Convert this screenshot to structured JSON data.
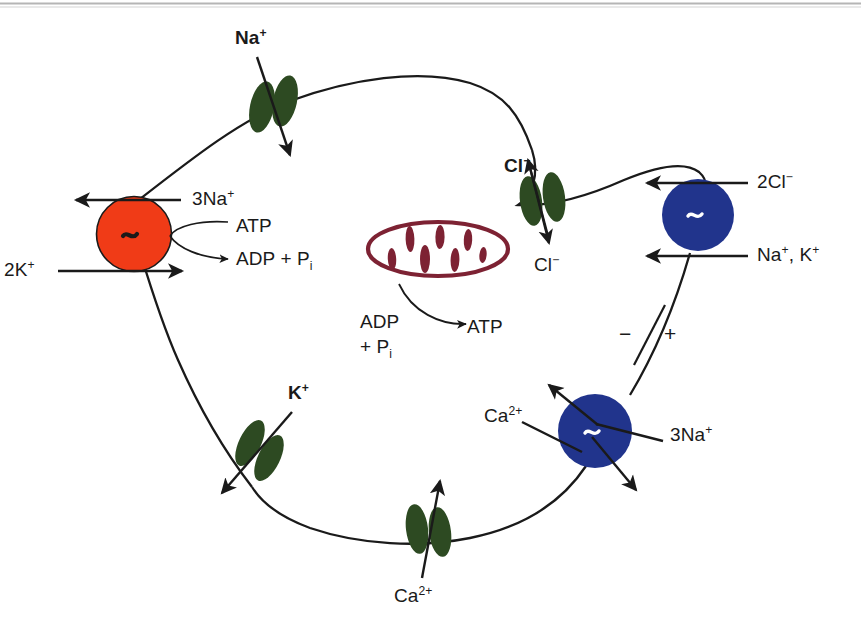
{
  "figure": {
    "kind": "cell-membrane-transport-diagram",
    "background": "#ffffff",
    "top_rule_color": "#9a9a9a"
  },
  "colors": {
    "atpase_red": "#f03b17",
    "transporter_blue": "#21348c",
    "channel_green": "#2d4a22",
    "mitochondrion_maroon": "#7d2233",
    "stroke_black": "#1a1a1a",
    "text_black": "#1a1a1a"
  },
  "pumps": [
    {
      "id": "na-k-atpase",
      "color": "#f03b17",
      "symbol": "~",
      "symbol_color": "#1a1a1a",
      "labels": {
        "out": "3Na",
        "out_charge": "+",
        "in": "2K",
        "in_charge": "+",
        "energy_in": "ATP",
        "energy_out": "ADP + P",
        "energy_out_sub": "i"
      }
    },
    {
      "id": "na-k-2cl-cotransporter",
      "color": "#21348c",
      "symbol": "~",
      "symbol_color": "#ffffff",
      "labels": {
        "top": "2Cl",
        "top_charge": "−",
        "bottom": "Na",
        "bottom_charge_1": "+",
        "bottom_2": ", K",
        "bottom_charge_2": "+"
      }
    },
    {
      "id": "na-ca-exchanger",
      "color": "#21348c",
      "symbol": "~",
      "symbol_color": "#ffffff",
      "labels": {
        "left": "Ca",
        "left_charge": "2+",
        "right": "3Na",
        "right_charge": "+",
        "minus_sign": "−",
        "plus_sign": "+"
      }
    }
  ],
  "channels": [
    {
      "id": "sodium-channel",
      "ion": "Na",
      "charge": "+",
      "direction": "inward",
      "color": "#2d4a22"
    },
    {
      "id": "chloride-channel",
      "ion_top": "Cl",
      "charge_top": "−",
      "ion_bottom": "Cl",
      "charge_bottom": "−",
      "direction": "bidirectional",
      "color": "#2d4a22"
    },
    {
      "id": "potassium-channel",
      "ion": "K",
      "charge": "+",
      "direction": "outward",
      "color": "#2d4a22"
    },
    {
      "id": "calcium-channel",
      "ion": "Ca",
      "charge": "2+",
      "direction": "inward",
      "color": "#2d4a22"
    }
  ],
  "organelle": {
    "id": "mitochondrion",
    "outline_color": "#7d2233",
    "cristae_count": 7,
    "reaction": {
      "substrate_line1": "ADP",
      "substrate_line2": "+ P",
      "substrate_sub": "i",
      "product": "ATP"
    }
  },
  "labels": {
    "na_channel": {
      "text": "Na",
      "charge": "+"
    },
    "cl_channel_top": {
      "text": "Cl",
      "charge": "−"
    },
    "cl_channel_bottom": {
      "text": "Cl",
      "charge": "−"
    },
    "k_channel": {
      "text": "K",
      "charge": "+"
    },
    "ca_channel": {
      "text": "Ca",
      "charge": "2+"
    },
    "pump_na_out": {
      "text": "3Na",
      "charge": "+"
    },
    "pump_k_in": {
      "text": "2K",
      "charge": "+"
    },
    "atp": {
      "text": "ATP"
    },
    "adp_pi": {
      "text": "ADP + P",
      "sub": "i"
    },
    "cotransport_cl": {
      "text": "2Cl",
      "charge": "−"
    },
    "cotransport_nak": {
      "text": "Na",
      "charge1": "+",
      "text2": ", K",
      "charge2": "+"
    },
    "exchanger_ca": {
      "text": "Ca",
      "charge": "2+"
    },
    "exchanger_na": {
      "text": "3Na",
      "charge": "+"
    },
    "mito_adp": {
      "line1": "ADP",
      "line2": "+ P",
      "sub": "i"
    },
    "mito_atp": {
      "text": "ATP"
    },
    "polarity_minus": {
      "text": "−"
    },
    "polarity_plus": {
      "text": "+"
    }
  }
}
